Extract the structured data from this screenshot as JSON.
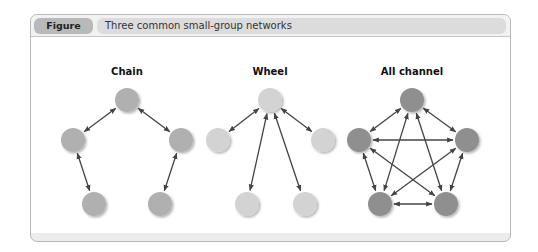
{
  "figure": {
    "label": "Figure 11.2",
    "title": "Three common small-group networks"
  },
  "networks": [
    {
      "name": "Chain",
      "node_color": "#b0b0b0",
      "nodes": [
        [
          127,
          100
        ],
        [
          73,
          140
        ],
        [
          181,
          140
        ],
        [
          94,
          204
        ],
        [
          160,
          204
        ]
      ],
      "edges": [
        [
          0,
          1
        ],
        [
          0,
          2
        ],
        [
          1,
          3
        ],
        [
          2,
          4
        ]
      ]
    },
    {
      "name": "Wheel",
      "node_color": "#d3d3d3",
      "nodes": [
        [
          270,
          100
        ],
        [
          218,
          140
        ],
        [
          323,
          140
        ],
        [
          247,
          204
        ],
        [
          305,
          204
        ]
      ],
      "edges": [
        [
          0,
          1
        ],
        [
          0,
          2
        ],
        [
          0,
          3
        ],
        [
          0,
          4
        ]
      ]
    },
    {
      "name": "All channel",
      "node_color": "#8f8f8f",
      "nodes": [
        [
          412,
          100
        ],
        [
          359,
          140
        ],
        [
          467,
          140
        ],
        [
          380,
          204
        ],
        [
          446,
          204
        ]
      ],
      "edges": [
        [
          0,
          1
        ],
        [
          0,
          2
        ],
        [
          0,
          3
        ],
        [
          0,
          4
        ],
        [
          1,
          2
        ],
        [
          1,
          3
        ],
        [
          1,
          4
        ],
        [
          2,
          3
        ],
        [
          2,
          4
        ],
        [
          3,
          4
        ]
      ]
    }
  ],
  "colors": {
    "edge": "#444444",
    "panel_border": "#b8b8b8",
    "label_bg": "#b9b9b9",
    "title_bg": "#dcdcdc"
  }
}
